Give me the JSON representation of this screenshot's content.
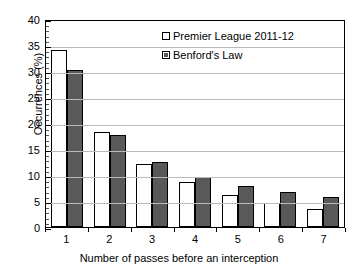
{
  "chart_data": {
    "type": "bar",
    "title": "",
    "xlabel": "Number of passes before an interception",
    "ylabel": "Occurrences (%)",
    "categories": [
      "1",
      "2",
      "3",
      "4",
      "5",
      "6",
      "7"
    ],
    "series": [
      {
        "name": "Premier League 2011-12",
        "color": "#ffffff",
        "values": [
          34.0,
          18.3,
          12.2,
          8.6,
          6.2,
          4.7,
          3.5
        ]
      },
      {
        "name": "Benford's Law",
        "color": "#595959",
        "values": [
          30.1,
          17.6,
          12.5,
          9.7,
          7.9,
          6.7,
          5.8
        ]
      }
    ],
    "ylim": [
      0,
      40
    ],
    "ytick_step": 5,
    "yticks": [
      "0",
      "5",
      "10",
      "15",
      "20",
      "25",
      "30",
      "35",
      "40"
    ],
    "y_minor_step": 1,
    "grid": true,
    "legend_position": "top-center"
  },
  "legend": {
    "items": [
      {
        "label": "Premier League 2011-12",
        "marker": "open-square-swatch"
      },
      {
        "label": "Benford's Law",
        "marker": "filled-square-swatch"
      }
    ]
  }
}
